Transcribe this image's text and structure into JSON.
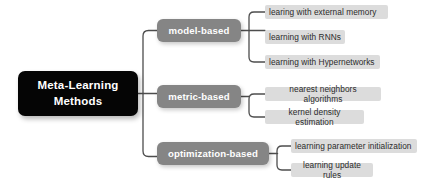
{
  "diagram": {
    "type": "mind-map",
    "colors": {
      "root_background": "#050505",
      "root_text": "#ffffff",
      "branch_background": "#858585",
      "branch_text": "#ffffff",
      "leaf_background": "#dcdcdc",
      "leaf_text": "#2b2b2b",
      "connector": "#4d4d4d",
      "canvas": "#ffffff"
    },
    "root": {
      "label": "Meta-Learning Methods",
      "line1": "Meta-Learning",
      "line2": "Methods"
    },
    "branches": [
      {
        "label": "model-based",
        "leaves": [
          "learing with external memory",
          "learning with RNNs",
          "learning with Hypernetworks"
        ]
      },
      {
        "label": "metric-based",
        "leaves": [
          "nearest neighbors algorithms",
          "kernel density estimation"
        ]
      },
      {
        "label": "optimization-based",
        "leaves": [
          "learning parameter initialization",
          "learning update rules"
        ]
      }
    ]
  }
}
